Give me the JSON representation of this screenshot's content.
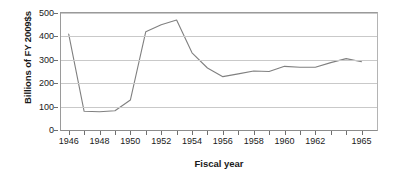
{
  "chart_data": {
    "type": "line",
    "title": "",
    "xlabel": "Fiscal year",
    "ylabel": "Billions of FY 2009$s",
    "xlim": [
      1945.5,
      1966.0
    ],
    "ylim": [
      0,
      500
    ],
    "yticks": [
      0,
      100,
      200,
      300,
      400,
      500
    ],
    "ytick_labels": [
      "0",
      "100",
      "200",
      "300",
      "400",
      "500"
    ],
    "xtick_values": [
      1946,
      1947,
      1948,
      1949,
      1950,
      1951,
      1952,
      1953,
      1954,
      1955,
      1956,
      1957,
      1958,
      1959,
      1960,
      1961,
      1962,
      1963,
      1964,
      1965
    ],
    "xtick_labels": [
      "1946",
      "",
      "1948",
      "",
      "1950",
      "",
      "1952",
      "",
      "1954",
      "",
      "1956",
      "",
      "1958",
      "",
      "1960",
      "",
      "1962",
      "",
      "",
      "1965"
    ],
    "grid": true,
    "grid_axis": "y",
    "legend": false,
    "line_color": "#808080",
    "series": [
      {
        "name": "Defense outlays",
        "x": [
          1946,
          1947,
          1948,
          1949,
          1950,
          1951,
          1952,
          1953,
          1954,
          1955,
          1956,
          1957,
          1958,
          1959,
          1960,
          1961,
          1962,
          1963,
          1964,
          1965
        ],
        "values": [
          410,
          80,
          78,
          82,
          128,
          420,
          450,
          470,
          330,
          265,
          228,
          240,
          252,
          250,
          272,
          268,
          268,
          288,
          305,
          292
        ]
      }
    ]
  },
  "axis": {
    "ylabel_text": "Billions of FY 2009$s",
    "xlabel_text": "Fiscal year"
  }
}
